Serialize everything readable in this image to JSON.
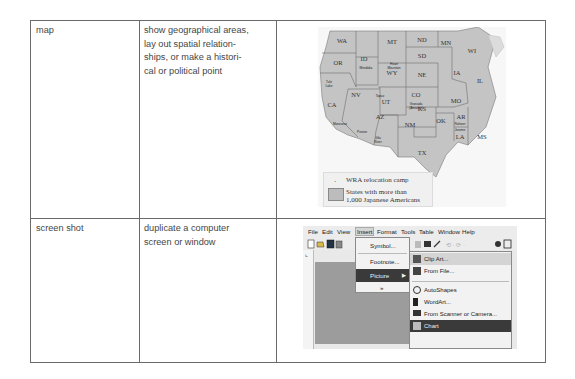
{
  "table": {
    "rows": [
      {
        "type": "map",
        "use": [
          "show geographical areas,",
          "lay out spatial relation-",
          "ships, or make a histori-",
          "cal or political point"
        ]
      },
      {
        "type": "screen shot",
        "use": [
          "duplicate a computer",
          "screen or window"
        ]
      }
    ]
  },
  "map_example": {
    "states": [
      "WA",
      "OR",
      "ID",
      "MT",
      "ND",
      "MN",
      "WI",
      "SD",
      "WY",
      "NE",
      "IA",
      "IL",
      "NV",
      "CA",
      "UT",
      "CO",
      "KS",
      "MO",
      "AZ",
      "NM",
      "OK",
      "AR",
      "MS",
      "LA",
      "TX"
    ],
    "camps": [
      "Tule Lake",
      "Minidoka",
      "Heart Mountain",
      "Topaz",
      "Granada (Amache)",
      "Manzanar",
      "Poston",
      "Gila River",
      "Rohwer",
      "Jerome"
    ],
    "legend": {
      "camp_label": "WRA relocation camp",
      "states_label_line1": "States with more than",
      "states_label_line2": "1,000 Japanese Americans"
    }
  },
  "screenshot_example": {
    "menubar": [
      "File",
      "Edit",
      "View",
      "Insert",
      "Format",
      "Tools",
      "Table",
      "Window",
      "Help"
    ],
    "insert_menu": [
      "Symbol...",
      "Footnote...",
      "Picture",
      "»"
    ],
    "picture_submenu": [
      "Clip Art...",
      "From File...",
      "AutoShapes",
      "WordArt...",
      "From Scanner or Camera...",
      "Chart"
    ]
  }
}
